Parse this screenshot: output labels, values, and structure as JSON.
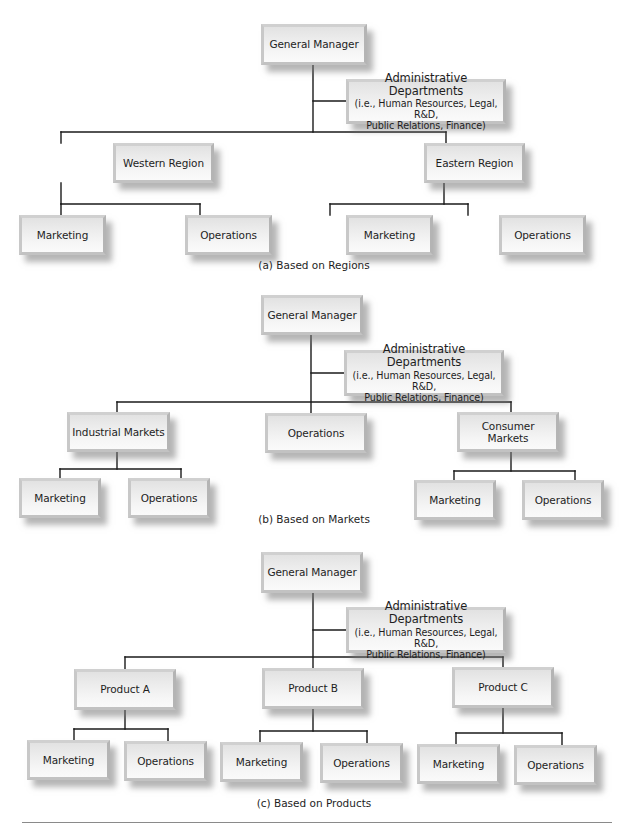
{
  "colors": {
    "line": "#1a1a1a",
    "box_top": "#e2e2e2",
    "box_bottom": "#fafafa",
    "shadow": "#9a9a9a",
    "rule": "#8a8a8a"
  },
  "sections": [
    {
      "id": "a",
      "caption": "(a) Based on Regions",
      "caption_y": 266,
      "nodes": [
        {
          "id": "gm",
          "label": "General Manager",
          "x": 261,
          "y": 24,
          "w": 106,
          "h": 41
        },
        {
          "id": "admin",
          "label": "Administrative Departments",
          "sub": [
            "(i.e., Human Resources, Legal, R&D,",
            "Public Relations, Finance)"
          ],
          "x": 346,
          "y": 79,
          "w": 160,
          "h": 45,
          "admin": true
        },
        {
          "id": "west",
          "label": "Western Region",
          "x": 113,
          "y": 143,
          "w": 101,
          "h": 40
        },
        {
          "id": "east",
          "label": "Eastern Region",
          "x": 424,
          "y": 143,
          "w": 101,
          "h": 40
        },
        {
          "id": "west-mkt",
          "label": "Marketing",
          "x": 19,
          "y": 215,
          "w": 87,
          "h": 40
        },
        {
          "id": "west-ops",
          "label": "Operations",
          "x": 185,
          "y": 215,
          "w": 87,
          "h": 40
        },
        {
          "id": "east-mkt",
          "label": "Marketing",
          "x": 346,
          "y": 215,
          "w": 87,
          "h": 40
        },
        {
          "id": "east-ops",
          "label": "Operations",
          "x": 499,
          "y": 215,
          "w": 87,
          "h": 40
        }
      ],
      "lines": [
        [
          313,
          65,
          313,
          132
        ],
        [
          313,
          101,
          346,
          101
        ],
        [
          61,
          132,
          446,
          132
        ],
        [
          61,
          132,
          61,
          143
        ],
        [
          446,
          132,
          446,
          143
        ],
        [
          61,
          183,
          61,
          204
        ],
        [
          444,
          183,
          444,
          204
        ],
        [
          61,
          204,
          200,
          204
        ],
        [
          61,
          204,
          61,
          215
        ],
        [
          200,
          204,
          200,
          215
        ],
        [
          330,
          204,
          468,
          204
        ],
        [
          330,
          204,
          330,
          215
        ],
        [
          468,
          204,
          468,
          215
        ]
      ]
    },
    {
      "id": "b",
      "caption": "(b) Based on Markets",
      "caption_y": 520,
      "nodes": [
        {
          "id": "gm",
          "label": "General Manager",
          "x": 261,
          "y": 295,
          "w": 102,
          "h": 40
        },
        {
          "id": "admin",
          "label": "Administrative Departments",
          "sub": [
            "(i.e., Human Resources, Legal, R&D,",
            "Public Relations, Finance)"
          ],
          "x": 344,
          "y": 350,
          "w": 160,
          "h": 46,
          "admin": true
        },
        {
          "id": "industrial",
          "label": "Industrial Markets",
          "x": 67,
          "y": 412,
          "w": 103,
          "h": 40
        },
        {
          "id": "ops",
          "label": "Operations",
          "x": 265,
          "y": 413,
          "w": 102,
          "h": 40
        },
        {
          "id": "consumer",
          "label": "Consumer Markets",
          "x": 457,
          "y": 412,
          "w": 102,
          "h": 40
        },
        {
          "id": "ind-mkt",
          "label": "Marketing",
          "x": 19,
          "y": 478,
          "w": 82,
          "h": 40
        },
        {
          "id": "ind-ops",
          "label": "Operations",
          "x": 128,
          "y": 478,
          "w": 82,
          "h": 40
        },
        {
          "id": "con-mkt",
          "label": "Marketing",
          "x": 414,
          "y": 480,
          "w": 82,
          "h": 40
        },
        {
          "id": "con-ops",
          "label": "Operations",
          "x": 522,
          "y": 480,
          "w": 82,
          "h": 40
        }
      ],
      "lines": [
        [
          311,
          335,
          311,
          413
        ],
        [
          311,
          373,
          344,
          373
        ],
        [
          117,
          402,
          511,
          402
        ],
        [
          117,
          402,
          117,
          412
        ],
        [
          511,
          402,
          511,
          412
        ],
        [
          117,
          452,
          117,
          469
        ],
        [
          60,
          469,
          181,
          469
        ],
        [
          60,
          469,
          60,
          478
        ],
        [
          181,
          469,
          181,
          478
        ],
        [
          511,
          452,
          511,
          471
        ],
        [
          454,
          471,
          575,
          471
        ],
        [
          454,
          471,
          454,
          480
        ],
        [
          575,
          471,
          575,
          480
        ]
      ]
    },
    {
      "id": "c",
      "caption": "(c) Based on Products",
      "caption_y": 804,
      "nodes": [
        {
          "id": "gm",
          "label": "General Manager",
          "x": 261,
          "y": 552,
          "w": 102,
          "h": 41
        },
        {
          "id": "admin",
          "label": "Administrative Departments",
          "sub": [
            "(i.e., Human Resources, Legal, R&D,",
            "Public Relations, Finance)"
          ],
          "x": 346,
          "y": 607,
          "w": 160,
          "h": 46,
          "admin": true
        },
        {
          "id": "prod-a",
          "label": "Product A",
          "x": 74,
          "y": 669,
          "w": 102,
          "h": 41
        },
        {
          "id": "prod-b",
          "label": "Product B",
          "x": 262,
          "y": 668,
          "w": 102,
          "h": 41
        },
        {
          "id": "prod-c",
          "label": "Product C",
          "x": 452,
          "y": 667,
          "w": 102,
          "h": 41
        },
        {
          "id": "a-mkt",
          "label": "Marketing",
          "x": 27,
          "y": 740,
          "w": 83,
          "h": 40
        },
        {
          "id": "a-ops",
          "label": "Operations",
          "x": 124,
          "y": 741,
          "w": 83,
          "h": 40
        },
        {
          "id": "b-mkt",
          "label": "Marketing",
          "x": 220,
          "y": 742,
          "w": 83,
          "h": 40
        },
        {
          "id": "b-ops",
          "label": "Operations",
          "x": 320,
          "y": 743,
          "w": 83,
          "h": 40
        },
        {
          "id": "c-mkt",
          "label": "Marketing",
          "x": 417,
          "y": 744,
          "w": 83,
          "h": 40
        },
        {
          "id": "c-ops",
          "label": "Operations",
          "x": 514,
          "y": 745,
          "w": 83,
          "h": 40
        }
      ],
      "lines": [
        [
          313,
          593,
          313,
          668
        ],
        [
          313,
          630,
          346,
          630
        ],
        [
          125,
          657,
          503,
          657
        ],
        [
          125,
          657,
          125,
          669
        ],
        [
          503,
          657,
          503,
          667
        ],
        [
          125,
          710,
          125,
          729
        ],
        [
          74,
          729,
          168,
          729
        ],
        [
          74,
          729,
          74,
          740
        ],
        [
          168,
          729,
          168,
          741
        ],
        [
          313,
          709,
          313,
          731
        ],
        [
          260,
          731,
          367,
          731
        ],
        [
          260,
          731,
          260,
          742
        ],
        [
          367,
          731,
          367,
          743
        ],
        [
          503,
          708,
          503,
          733
        ],
        [
          456,
          733,
          562,
          733
        ],
        [
          456,
          733,
          456,
          744
        ],
        [
          562,
          733,
          562,
          745
        ]
      ]
    }
  ]
}
